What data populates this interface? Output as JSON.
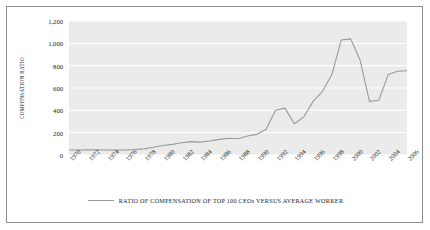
{
  "chart_data": {
    "type": "line",
    "title": "",
    "xlabel": "",
    "ylabel": "COMPENSATION RATIO",
    "ylim": [
      0,
      1200
    ],
    "xlim": [
      1970,
      2006
    ],
    "grid": true,
    "legend_position": "bottom",
    "y_ticks": [
      "0",
      "200",
      "400",
      "600",
      "800",
      "1,000",
      "1,200"
    ],
    "y_tick_values": [
      0,
      200,
      400,
      600,
      800,
      1000,
      1200
    ],
    "x_ticks": [
      "1970",
      "1972",
      "1974",
      "1976",
      "1978",
      "1980",
      "1982",
      "1984",
      "1986",
      "1988",
      "1990",
      "1992",
      "1994",
      "1996",
      "1998",
      "2000",
      "2002",
      "2004",
      "2006"
    ],
    "x_tick_values": [
      1970,
      1972,
      1974,
      1976,
      1978,
      1980,
      1982,
      1984,
      1986,
      1988,
      1990,
      1992,
      1994,
      1996,
      1998,
      2000,
      2002,
      2004,
      2006
    ],
    "x": [
      1970,
      1971,
      1972,
      1973,
      1974,
      1975,
      1976,
      1977,
      1978,
      1979,
      1980,
      1981,
      1982,
      1983,
      1984,
      1985,
      1986,
      1987,
      1988,
      1989,
      1990,
      1991,
      1992,
      1993,
      1994,
      1995,
      1996,
      1997,
      1998,
      1999,
      2000,
      2001,
      2002,
      2003,
      2004,
      2005,
      2006
    ],
    "series": [
      {
        "name": "RATIO OF COMPENSATION OF TOP 100 CEOs VERSUS AVERAGE WORKER",
        "color": "#9a9a9a",
        "values": [
          45,
          45,
          46,
          46,
          45,
          44,
          45,
          48,
          55,
          70,
          85,
          95,
          110,
          120,
          115,
          125,
          140,
          150,
          145,
          170,
          185,
          230,
          400,
          420,
          280,
          340,
          480,
          570,
          720,
          1030,
          1040,
          850,
          480,
          490,
          720,
          750,
          755
        ]
      }
    ],
    "legend": [
      "RATIO OF COMPENSATION OF TOP 100 CEOs VERSUS AVERAGE WORKER"
    ],
    "colors": {
      "line": "#9a9a9a",
      "plot_background": "#ebebeb",
      "gridline": "#ffffff",
      "border": "#8e8e8e",
      "text": "#1b1b1b"
    }
  }
}
